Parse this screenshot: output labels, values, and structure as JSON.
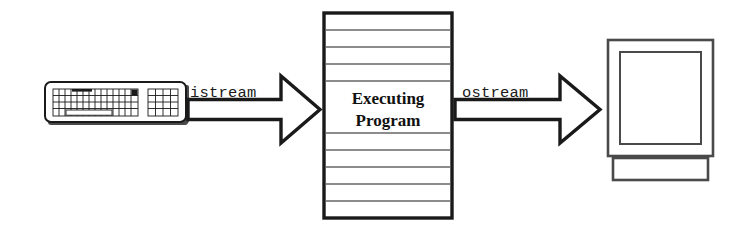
{
  "diagram": {
    "background_color": "#ffffff",
    "ink_color": "#1a1a1a",
    "input_device": {
      "name": "keyboard",
      "label": ""
    },
    "output_device": {
      "name": "monitor",
      "label": ""
    },
    "input_arrow": {
      "label": "istream",
      "direction": "right",
      "from": "keyboard",
      "to": "executing-program"
    },
    "output_arrow": {
      "label": "ostream",
      "direction": "right",
      "from": "executing-program",
      "to": "monitor"
    },
    "process_box": {
      "label_line1": "Executing",
      "label_line2": "Program",
      "ruled_lines": 12
    }
  }
}
